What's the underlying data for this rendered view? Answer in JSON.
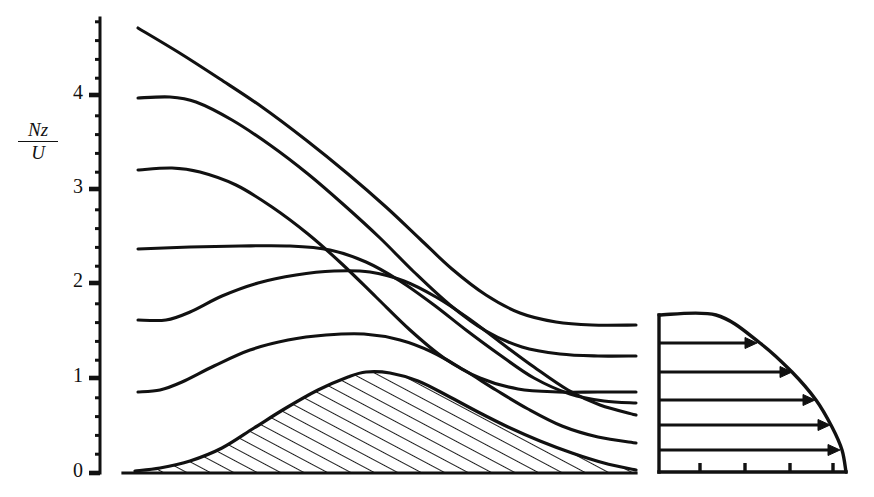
{
  "figure": {
    "background_color": "#ffffff",
    "ink_color": "#111111",
    "width": 874,
    "height": 497
  },
  "axis": {
    "y_label_numerator": "Nz",
    "y_label_denominator": "U",
    "y_label_full": "Nz/U",
    "tick_labels": [
      "0",
      "1",
      "2",
      "3",
      "4"
    ],
    "tick_values": [
      0,
      1,
      2,
      3,
      4
    ],
    "tick_pixel_y": [
      473,
      378,
      283,
      189,
      95
    ],
    "axis_pixel_x": 100,
    "axis_top_pixel_y": 18,
    "axis_bottom_pixel_y": 473,
    "minor_ticks_per_major": 5,
    "major_tick_length": 11,
    "minor_tick_length": 5,
    "tick_side": "left"
  },
  "chart_data": {
    "type": "line",
    "xlabel": "",
    "ylabel": "Nz/U",
    "ylim": [
      0,
      4.82
    ],
    "xlim": [
      0,
      5.3
    ],
    "grid": false,
    "legend": "none",
    "x_axis_visible": false,
    "plot_box_px": {
      "left": 135,
      "right": 636,
      "top": 18,
      "bottom": 473
    },
    "px_per_x_unit": 94.5,
    "px_per_y_unit": 94.5,
    "series": [
      {
        "name": "streamline-7",
        "role": "streamline",
        "upstream_level": 4.71,
        "downstream_level": 1.61,
        "points_px": [
          [
            138,
            28
          ],
          [
            178,
            52
          ],
          [
            220,
            79
          ],
          [
            262,
            107
          ],
          [
            306,
            140
          ],
          [
            348,
            174
          ],
          [
            386,
            207
          ],
          [
            420,
            239
          ],
          [
            452,
            269
          ],
          [
            486,
            295
          ],
          [
            520,
            313
          ],
          [
            556,
            322
          ],
          [
            592,
            325
          ],
          [
            636,
            325
          ]
        ]
      },
      {
        "name": "streamline-6",
        "role": "streamline",
        "upstream_level": 3.97,
        "downstream_level": 1.3,
        "points_px": [
          [
            138,
            98
          ],
          [
            170,
            97
          ],
          [
            196,
            102
          ],
          [
            232,
            120
          ],
          [
            270,
            145
          ],
          [
            308,
            174
          ],
          [
            344,
            205
          ],
          [
            380,
            238
          ],
          [
            414,
            272
          ],
          [
            450,
            305
          ],
          [
            486,
            331
          ],
          [
            522,
            347
          ],
          [
            560,
            354
          ],
          [
            598,
            356
          ],
          [
            636,
            356
          ]
        ]
      },
      {
        "name": "streamline-5",
        "role": "streamline",
        "upstream_level": 3.22,
        "downstream_level": 1.12,
        "points_px": [
          [
            138,
            170
          ],
          [
            172,
            168
          ],
          [
            200,
            172
          ],
          [
            236,
            185
          ],
          [
            272,
            207
          ],
          [
            308,
            234
          ],
          [
            342,
            264
          ],
          [
            376,
            297
          ],
          [
            410,
            330
          ],
          [
            444,
            358
          ],
          [
            480,
            378
          ],
          [
            518,
            389
          ],
          [
            558,
            392
          ],
          [
            598,
            392
          ],
          [
            636,
            392
          ]
        ]
      },
      {
        "name": "streamline-4",
        "role": "streamline",
        "upstream_level": 2.37,
        "downstream_level": 0.84,
        "points_px": [
          [
            138,
            249
          ],
          [
            190,
            247
          ],
          [
            240,
            246
          ],
          [
            290,
            246
          ],
          [
            330,
            250
          ],
          [
            366,
            262
          ],
          [
            400,
            281
          ],
          [
            434,
            305
          ],
          [
            466,
            330
          ],
          [
            500,
            355
          ],
          [
            534,
            378
          ],
          [
            570,
            394
          ],
          [
            604,
            401
          ],
          [
            636,
            403
          ]
        ]
      },
      {
        "name": "streamline-3",
        "role": "streamline",
        "upstream_level": 1.61,
        "downstream_level": 0.62,
        "points_px": [
          [
            138,
            320
          ],
          [
            166,
            320
          ],
          [
            190,
            312
          ],
          [
            222,
            296
          ],
          [
            258,
            283
          ],
          [
            296,
            275
          ],
          [
            334,
            271
          ],
          [
            370,
            272
          ],
          [
            404,
            281
          ],
          [
            436,
            297
          ],
          [
            468,
            318
          ],
          [
            500,
            342
          ],
          [
            534,
            367
          ],
          [
            568,
            390
          ],
          [
            600,
            405
          ],
          [
            636,
            415
          ]
        ]
      },
      {
        "name": "streamline-2",
        "role": "streamline",
        "upstream_level": 0.81,
        "downstream_level": 0.42,
        "points_px": [
          [
            138,
            392
          ],
          [
            160,
            390
          ],
          [
            182,
            382
          ],
          [
            214,
            366
          ],
          [
            250,
            350
          ],
          [
            288,
            340
          ],
          [
            326,
            335
          ],
          [
            364,
            334
          ],
          [
            400,
            340
          ],
          [
            432,
            352
          ],
          [
            464,
            370
          ],
          [
            496,
            390
          ],
          [
            528,
            409
          ],
          [
            562,
            426
          ],
          [
            598,
            437
          ],
          [
            636,
            443
          ]
        ]
      },
      {
        "name": "mountain-surface",
        "role": "terrain-outline",
        "peak_height": 1.08,
        "peak_x_px": 366,
        "points_px": [
          [
            135,
            471
          ],
          [
            160,
            468
          ],
          [
            190,
            461
          ],
          [
            222,
            448
          ],
          [
            254,
            428
          ],
          [
            286,
            408
          ],
          [
            318,
            390
          ],
          [
            348,
            377
          ],
          [
            366,
            372
          ],
          [
            390,
            373
          ],
          [
            418,
            381
          ],
          [
            448,
            396
          ],
          [
            478,
            412
          ],
          [
            508,
            427
          ],
          [
            540,
            441
          ],
          [
            572,
            453
          ],
          [
            604,
            463
          ],
          [
            636,
            470
          ],
          [
            636,
            473
          ],
          [
            135,
            473
          ]
        ]
      }
    ],
    "shaded_region": {
      "name": "mountain",
      "fill": "hatch",
      "hatch_angle_deg": 62,
      "hatch_spacing_px": 11,
      "hatch_color": "#111111",
      "outline_color": "#111111",
      "baseline_y_px": 473
    },
    "inset": {
      "name": "upstream-velocity-profile",
      "type": "profile",
      "box_px": {
        "left": 659,
        "right": 846,
        "top": 315,
        "bottom": 472
      },
      "description": "Upstream horizontal velocity profile U(z) with arrows whose length increases with height up to a maximum then the top corner is cut by a curved boundary",
      "left_axis": true,
      "bottom_axis": true,
      "bottom_tick_count": 4,
      "bottom_tick_pixel_x": [
        700,
        745,
        790,
        833
      ],
      "bottom_tick_height_px": 9,
      "arrows": [
        {
          "index": 1,
          "y_px": 343,
          "tip_x_px": 757,
          "length_px": 98
        },
        {
          "index": 2,
          "y_px": 372,
          "tip_x_px": 792,
          "length_px": 133
        },
        {
          "index": 3,
          "y_px": 400,
          "tip_x_px": 815,
          "length_px": 156
        },
        {
          "index": 4,
          "y_px": 425,
          "tip_x_px": 830,
          "length_px": 171
        },
        {
          "index": 5,
          "y_px": 450,
          "tip_x_px": 840,
          "length_px": 181
        }
      ],
      "boundary_curve_px": [
        [
          659,
          315
        ],
        [
          716,
          315
        ],
        [
          760,
          343
        ],
        [
          792,
          372
        ],
        [
          816,
          400
        ],
        [
          832,
          427
        ],
        [
          842,
          450
        ],
        [
          846,
          472
        ]
      ],
      "arrow_head_length_px": 14,
      "arrow_head_width_px": 11
    }
  }
}
